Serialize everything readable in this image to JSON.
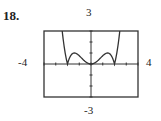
{
  "problem_number": "18.",
  "chart_data": {
    "type": "line",
    "title": "",
    "function": "y = |x^4 - 4x^2| / 4",
    "xlim": [
      -4,
      4
    ],
    "ylim": [
      -3,
      3
    ],
    "window_labels": {
      "ymax": "3",
      "ymin": "-3",
      "xmin": "-4",
      "xmax": "4"
    },
    "x_ticks": [
      -4,
      -3,
      -2,
      -1,
      0,
      1,
      2,
      3,
      4
    ],
    "y_ticks": [
      -3,
      -2,
      -1,
      0,
      1,
      2,
      3
    ],
    "zeros": [
      -2,
      0,
      2
    ],
    "local_maxima": [
      {
        "x": -1.414,
        "y": 1
      },
      {
        "x": 1.414,
        "y": 1
      }
    ],
    "grid": false,
    "legend": null
  }
}
